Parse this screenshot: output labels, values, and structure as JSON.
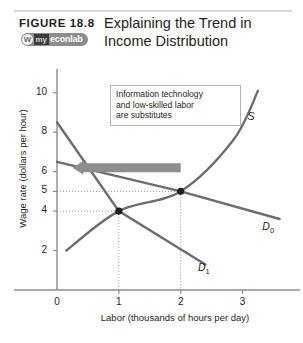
{
  "header": {
    "figure_number": "FIGURE  18.8",
    "title_lines": [
      "Explaining the Trend in",
      "Income Distribution"
    ],
    "logo": {
      "mark": "W",
      "prefix": "my",
      "name": "econlab"
    }
  },
  "annotation": {
    "lines": [
      "Information technology",
      "and low-skilled labor",
      "are substitutes"
    ]
  },
  "chart_data": {
    "type": "line",
    "title": "Explaining the Trend in Income Distribution",
    "xlabel": "Labor (thousands of hours per day)",
    "ylabel": "Wage rate (dollars per hour)",
    "xlim": [
      0,
      3.8
    ],
    "ylim": [
      0,
      11
    ],
    "xticks": [
      0,
      1,
      2,
      3
    ],
    "xtick_labels": [
      "0",
      "1",
      "2",
      "3"
    ],
    "yticks": [
      2,
      4,
      5,
      6,
      8,
      10
    ],
    "ytick_labels": [
      "2",
      "4",
      "5",
      "6",
      "8",
      "10"
    ],
    "grid": false,
    "legend_position": "inline-curve-labels",
    "series": [
      {
        "name": "S",
        "label": "S",
        "type": "supply",
        "points": [
          [
            0.15,
            2.0
          ],
          [
            1.0,
            4.0
          ],
          [
            2.0,
            5.0
          ],
          [
            2.85,
            7.6
          ],
          [
            3.25,
            10.1
          ]
        ]
      },
      {
        "name": "D0",
        "label": "D",
        "label_subscript": "0",
        "type": "demand",
        "points": [
          [
            0.0,
            6.5
          ],
          [
            2.0,
            5.0
          ],
          [
            3.6,
            3.6
          ]
        ]
      },
      {
        "name": "D1",
        "label": "D",
        "label_subscript": "1",
        "type": "demand",
        "points": [
          [
            0.0,
            8.5
          ],
          [
            1.0,
            4.0
          ],
          [
            2.4,
            1.3
          ]
        ]
      }
    ],
    "equilibria": [
      {
        "name": "initial",
        "x": 2,
        "y": 5,
        "marked": true
      },
      {
        "name": "new",
        "x": 1,
        "y": 4,
        "marked": true
      }
    ],
    "droplines": [
      {
        "x": 2,
        "y": 5
      },
      {
        "x": 1,
        "y": 4
      }
    ],
    "annotations": [
      {
        "type": "arrow",
        "direction": "left",
        "from_x": 2.0,
        "to_x": 0.25,
        "y": 6.2,
        "color": "#8e8e8e"
      }
    ]
  }
}
